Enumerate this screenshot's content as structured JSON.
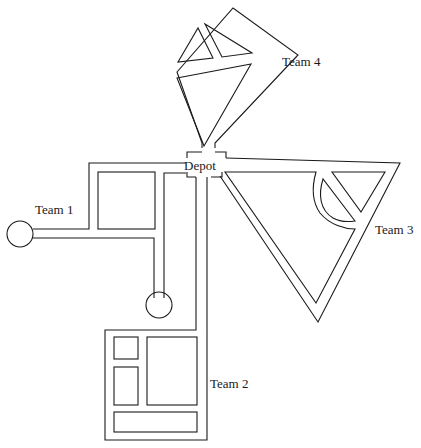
{
  "diagram": {
    "type": "route-map",
    "depot": {
      "label": "Depot"
    },
    "teams": [
      {
        "id": 1,
        "label": "Team 1"
      },
      {
        "id": 2,
        "label": "Team 2"
      },
      {
        "id": 3,
        "label": "Team 3"
      },
      {
        "id": 4,
        "label": "Team 4"
      }
    ],
    "colors": {
      "line": "#1a1a1a",
      "background": "#ffffff"
    }
  }
}
